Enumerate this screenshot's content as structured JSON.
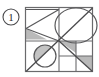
{
  "figure": {
    "label": "1",
    "label_shape": "circled-number",
    "colors": {
      "background": "#ffffff",
      "stroke": "#58585a",
      "stroke_dark": "#3d3d3f",
      "shade_fill": "#b9b9b9",
      "shade_fill_light": "#c9c9c9",
      "label_color": "#2b2b2b"
    },
    "frame": {
      "name": "outer-square",
      "x": 25,
      "y": 7,
      "width": 68,
      "height": 65
    },
    "guides": {
      "vertical_midline_x": 59,
      "horizontal_midline_y": 41,
      "center_x": 59,
      "center_y": 41
    },
    "shapes": [
      {
        "name": "top-left-triangle",
        "type": "triangle",
        "points": "25,9 59,9 25,39",
        "filled": false
      },
      {
        "name": "left-shaded-triangle",
        "type": "triangle",
        "points": "25,29 47,39 25,39",
        "filled": true
      },
      {
        "name": "top-right-ellipse",
        "type": "ellipse",
        "cx": 76,
        "cy": 26,
        "rx": 21,
        "ry": 18,
        "filled": false
      },
      {
        "name": "bottom-left-circle",
        "type": "circle",
        "cx": 45,
        "cy": 56,
        "r": 11,
        "filled": false
      },
      {
        "name": "circle-shaded-segment",
        "type": "segment",
        "filled": true
      },
      {
        "name": "right-shaded-triangle",
        "type": "triangle",
        "points": "59,41 76,41 76,53",
        "filled": true
      },
      {
        "name": "corner-shaded-triangle",
        "type": "triangle",
        "points": "76,56 93,56 93,72",
        "filled": true
      },
      {
        "name": "main-diagonal",
        "type": "line",
        "x1": 25,
        "y1": 72,
        "x2": 93,
        "y2": 7
      },
      {
        "name": "center-diagonal",
        "type": "line",
        "x1": 59,
        "y1": 41,
        "x2": 93,
        "y2": 72
      },
      {
        "name": "bottom-right-grid",
        "type": "grid",
        "rows": 2,
        "cols": 2,
        "x": 59,
        "y": 41,
        "width": 34,
        "height": 31
      }
    ]
  }
}
